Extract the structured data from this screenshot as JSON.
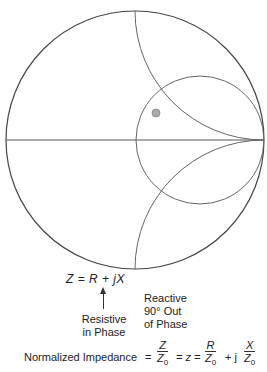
{
  "diagram": {
    "outer_circle": {
      "cx": 135,
      "cy": 140,
      "r": 129
    },
    "resistance_circle": {
      "cx": 200,
      "cy": 140,
      "r": 64,
      "label": "r = 1 circle"
    },
    "reactance_arcs": [
      {
        "name": "x=+1",
        "cx": 264,
        "cy": 11,
        "r": 129
      },
      {
        "name": "x=-1",
        "cx": 264,
        "cy": 269,
        "r": 129
      }
    ],
    "real_axis": {
      "x1": 6,
      "y1": 140,
      "x2": 264,
      "y2": 140
    },
    "marker": {
      "cx": 156,
      "cy": 113,
      "r": 4,
      "color": "#aaaaaa"
    },
    "line_color": "#555555"
  },
  "equation": {
    "main": "Z = R + jX",
    "reactive_label": "Reactive 90° Out of Phase",
    "reactive_lines": [
      "Reactive",
      "90° Out",
      "of Phase"
    ],
    "resistive_lines": [
      "Resistive",
      "in Phase"
    ]
  },
  "normalized": {
    "label": "Normalized Impedance",
    "eq1": "=",
    "frac1_num": "Z",
    "frac1_den": "Z0",
    "eq2": "= z =",
    "frac2_num": "R",
    "frac2_den": "Z0",
    "plus_j": "+ j",
    "frac3_num": "X",
    "frac3_den": "Z0"
  }
}
